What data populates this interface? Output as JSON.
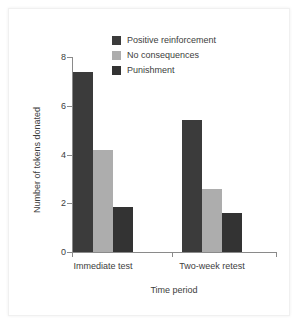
{
  "chart_data": {
    "type": "bar",
    "title": "",
    "subtitle": "",
    "xlabel": "Time period",
    "ylabel": "Number of tokens donated",
    "categories": [
      "Immediate test",
      "Two-week retest"
    ],
    "series": [
      {
        "name": "Positive reinforcement",
        "color": "#3b3b3b",
        "values": [
          7.4,
          5.4
        ]
      },
      {
        "name": "No consequences",
        "color": "#adadad",
        "values": [
          4.2,
          2.6
        ]
      },
      {
        "name": "Punishment",
        "color": "#333333",
        "values": [
          1.85,
          1.6
        ]
      }
    ],
    "ylim": [
      0,
      8
    ],
    "yticks": [
      0,
      2,
      4,
      6,
      8
    ],
    "ytick_labels": [
      "0",
      "2",
      "4",
      "6",
      "8"
    ],
    "grid": false,
    "legend_position": "top-center"
  },
  "axes": {
    "y_title": "Number of tokens donated",
    "x_title": "Time period"
  },
  "colors": {
    "axis": "#8a8a8a",
    "text": "#3d3d3d",
    "background": "#ffffff",
    "positive_reinforcement": "#3b3b3b",
    "no_consequences": "#adadad",
    "punishment": "#333333"
  }
}
